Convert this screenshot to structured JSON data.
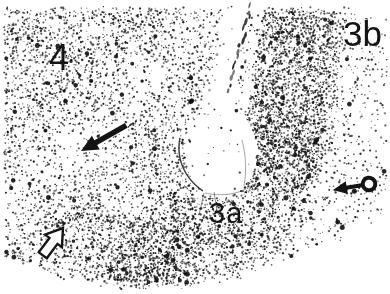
{
  "figure": {
    "kind": "grayscale tissue micrograph",
    "area_labels": [
      {
        "id": "area-4",
        "text": "4"
      },
      {
        "id": "area-3b",
        "text": "3b"
      },
      {
        "id": "area-3a",
        "text": "3a"
      }
    ],
    "annotations": [
      {
        "id": "solid-arrow",
        "shape": "filled arrow",
        "points": "down-left"
      },
      {
        "id": "open-arrow",
        "shape": "outlined arrow",
        "points": "up-right"
      },
      {
        "id": "circle-tail-arrow",
        "shape": "arrow with circular tail",
        "points": "left"
      }
    ],
    "palette": {
      "background": "#ffffff",
      "ink": "#141414"
    }
  }
}
